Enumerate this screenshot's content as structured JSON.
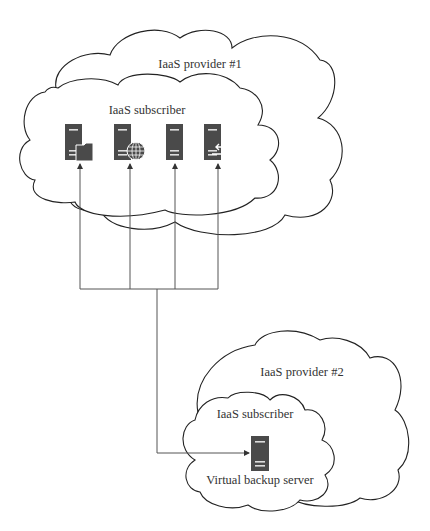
{
  "diagram": {
    "clouds": [
      {
        "id": "provider1",
        "label": "IaaS provider #1"
      },
      {
        "id": "subscriber1",
        "label": "IaaS subscriber"
      },
      {
        "id": "provider2",
        "label": "IaaS provider #2"
      },
      {
        "id": "subscriber2",
        "label": "IaaS subscriber"
      }
    ],
    "servers": [
      {
        "id": "file-server",
        "icon": "folder-icon"
      },
      {
        "id": "web-server",
        "icon": "globe-icon"
      },
      {
        "id": "plain-server",
        "icon": "none"
      },
      {
        "id": "exchange-server",
        "icon": "arrows-exchange-icon"
      },
      {
        "id": "backup-server",
        "label": "Virtual backup server"
      }
    ],
    "colors": {
      "line": "#444444",
      "server": "#4a4a4a",
      "cloud_stroke": "#222222"
    }
  }
}
